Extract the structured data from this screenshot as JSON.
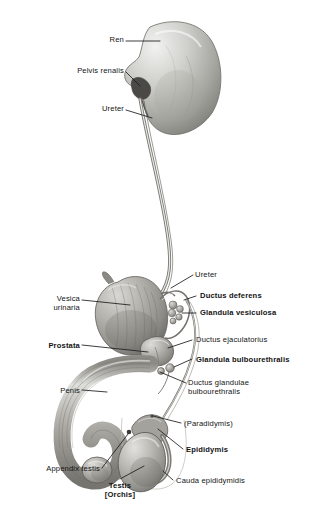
{
  "figure": {
    "background_color": "#ffffff",
    "ink_color": "#131313",
    "style": "grayscale anatomical halftone illustration with leader-line callouts"
  },
  "labels": [
    {
      "id": "ren",
      "text": "Ren",
      "bold": false,
      "align": "right",
      "x": 78,
      "y": 39,
      "w": 46
    },
    {
      "id": "pelvis-renalis",
      "text": "Pelvis renalis",
      "bold": false,
      "align": "right",
      "x": 38,
      "y": 70,
      "w": 86
    },
    {
      "id": "ureter-upper",
      "text": "Ureter",
      "bold": false,
      "align": "right",
      "x": 78,
      "y": 108,
      "w": 46
    },
    {
      "id": "vesica-urinaria",
      "text": "Vesica\nurinaria",
      "bold": false,
      "align": "right",
      "x": 22,
      "y": 294,
      "w": 58
    },
    {
      "id": "prostata",
      "text": "Prostata",
      "bold": true,
      "align": "right",
      "x": 14,
      "y": 341,
      "w": 66
    },
    {
      "id": "penis",
      "text": "Penis",
      "bold": false,
      "align": "right",
      "x": 32,
      "y": 386,
      "w": 48
    },
    {
      "id": "appendix-testis",
      "text": "Appendix testis",
      "bold": false,
      "align": "right",
      "x": 14,
      "y": 466,
      "w": 86
    },
    {
      "id": "testis-orchis",
      "text": "Testis\n[Orchis]",
      "bold": true,
      "align": "center",
      "x": 89,
      "y": 481,
      "w": 62
    },
    {
      "id": "ureter-lower",
      "text": "Ureter",
      "bold": false,
      "align": "left",
      "x": 195,
      "y": 272,
      "w": 60
    },
    {
      "id": "ductus-deferens",
      "text": "Ductus deferens",
      "bold": true,
      "align": "left",
      "x": 200,
      "y": 293,
      "w": 110
    },
    {
      "id": "gl-vesiculosa",
      "text": "Glandula vesiculosa",
      "bold": true,
      "align": "left",
      "x": 200,
      "y": 310,
      "w": 126
    },
    {
      "id": "ductus-ejac",
      "text": "Ductus ejaculatorius",
      "bold": false,
      "align": "left",
      "x": 196,
      "y": 337,
      "w": 124
    },
    {
      "id": "gl-bulbo",
      "text": "Glandula bulbourethralis",
      "bold": true,
      "align": "left",
      "x": 196,
      "y": 357,
      "w": 132
    },
    {
      "id": "ductus-gl-bulbo",
      "text": "Ductus glandulae\nbulbourethralis",
      "bold": false,
      "align": "left",
      "x": 188,
      "y": 380,
      "w": 110
    },
    {
      "id": "paradidymis",
      "text": "(Paradidymis)",
      "bold": false,
      "align": "left",
      "x": 184,
      "y": 421,
      "w": 86
    },
    {
      "id": "epididymis",
      "text": "Epididymis",
      "bold": true,
      "align": "left",
      "x": 186,
      "y": 447,
      "w": 80
    },
    {
      "id": "cauda-epi",
      "text": "Cauda epididymidis",
      "bold": false,
      "align": "left",
      "x": 176,
      "y": 478,
      "w": 116
    }
  ],
  "structures": [
    {
      "id": "kidney",
      "name": "Ren (kidney)"
    },
    {
      "id": "renal-pelvis",
      "name": "Pelvis renalis"
    },
    {
      "id": "ureter",
      "name": "Ureter"
    },
    {
      "id": "bladder",
      "name": "Vesica urinaria"
    },
    {
      "id": "seminal-vesicle",
      "name": "Glandula vesiculosa"
    },
    {
      "id": "ductus-deferens",
      "name": "Ductus deferens"
    },
    {
      "id": "prostate",
      "name": "Prostata"
    },
    {
      "id": "bulbourethral-gland",
      "name": "Glandula bulbourethralis"
    },
    {
      "id": "penis",
      "name": "Penis"
    },
    {
      "id": "glans",
      "name": "Glans penis"
    },
    {
      "id": "testis",
      "name": "Testis [Orchis]"
    },
    {
      "id": "epididymis",
      "name": "Epididymis"
    },
    {
      "id": "scrotum-outline",
      "name": "Scrotum outline"
    }
  ]
}
